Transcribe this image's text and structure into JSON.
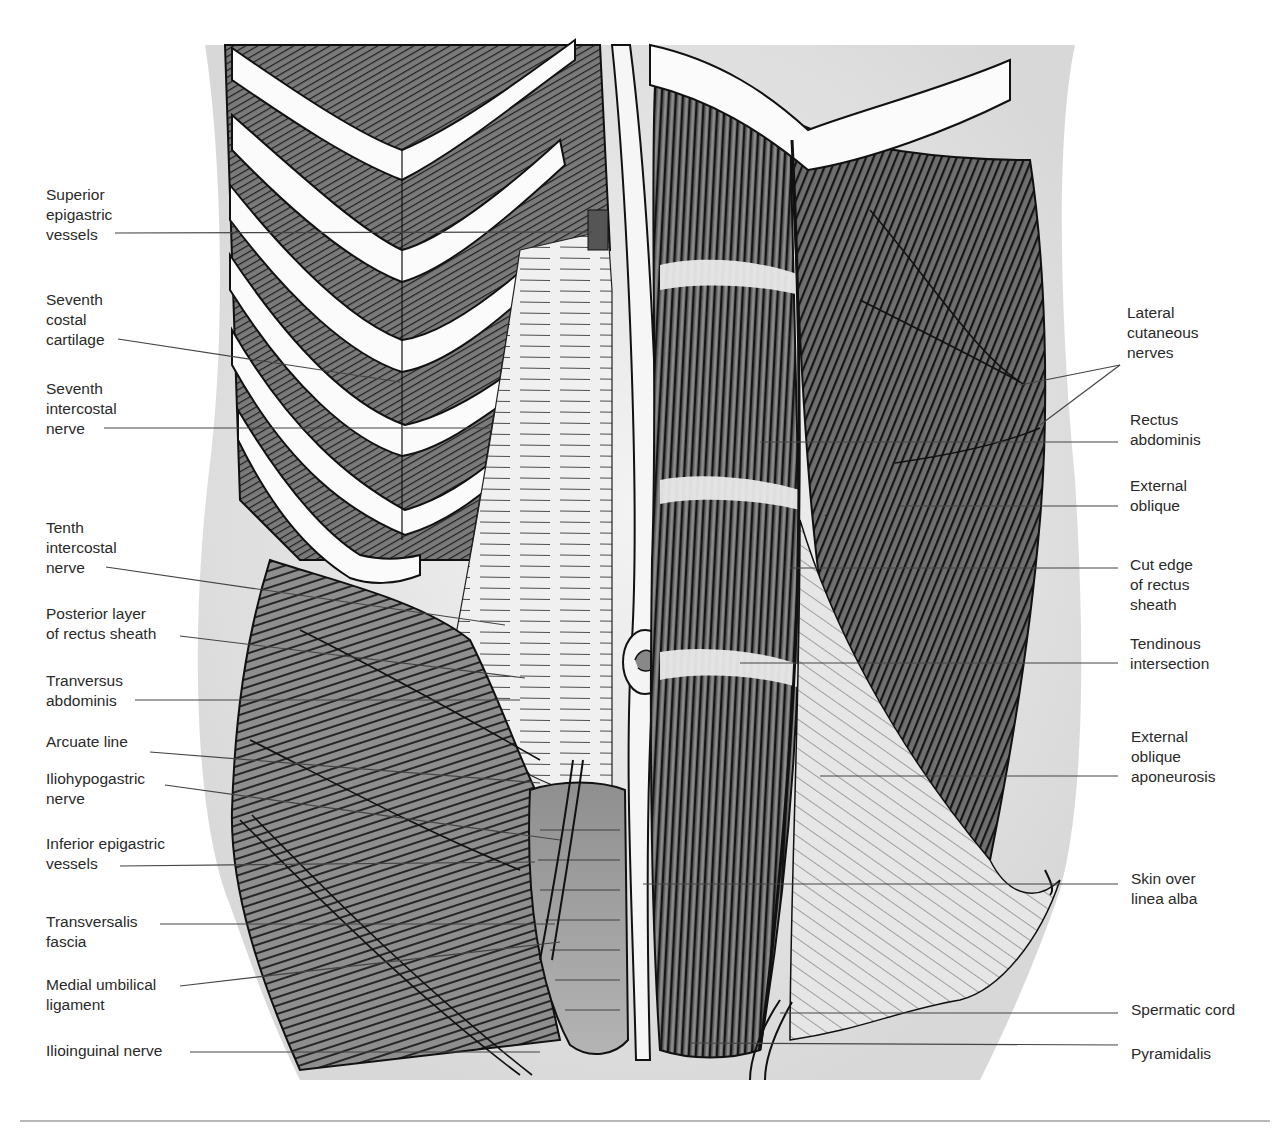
{
  "figure": {
    "colors": {
      "background": "#ffffff",
      "skin": "#efefef",
      "cartilage": "#fafafa",
      "muscle_dark": "#5a5a5a",
      "muscle_mid": "#8c8c8c",
      "sheath": "#e4e4e4",
      "fascia": "#9d9d9d",
      "line": "#1a1a1a",
      "leader": "#444444",
      "label_text": "#2a2a2a",
      "rule": "#b9b9b9"
    }
  },
  "labels_left": [
    {
      "id": "superior-epigastric-vessels",
      "text": "Superior\nepigastric\nvessels"
    },
    {
      "id": "seventh-costal-cartilage",
      "text": "Seventh\ncostal\ncartilage"
    },
    {
      "id": "seventh-intercostal-nerve",
      "text": "Seventh\nintercostal\nnerve"
    },
    {
      "id": "tenth-intercostal-nerve",
      "text": "Tenth\nintercostal\nnerve"
    },
    {
      "id": "posterior-layer-rectus-sheath",
      "text": "Posterior layer\nof rectus sheath"
    },
    {
      "id": "tranversus-abdominis",
      "text": "Tranversus\nabdominis"
    },
    {
      "id": "arcuate-line",
      "text": "Arcuate line"
    },
    {
      "id": "iliohypogastric-nerve",
      "text": "Iliohypogastric\nnerve"
    },
    {
      "id": "inferior-epigastric-vessels",
      "text": "Inferior epigastric\nvessels"
    },
    {
      "id": "transversalis-fascia",
      "text": "Transversalis\nfascia"
    },
    {
      "id": "medial-umbilical-ligament",
      "text": "Medial umbilical\nligament"
    },
    {
      "id": "ilioinguinal-nerve",
      "text": "Ilioinguinal nerve"
    }
  ],
  "labels_right": [
    {
      "id": "lateral-cutaneous-nerves",
      "text": "Lateral\ncutaneous\nnerves"
    },
    {
      "id": "rectus-abdominis",
      "text": "Rectus\nabdominis"
    },
    {
      "id": "external-oblique",
      "text": "External\noblique"
    },
    {
      "id": "cut-edge-rectus-sheath",
      "text": "Cut edge\nof rectus\nsheath"
    },
    {
      "id": "tendinous-intersection",
      "text": "Tendinous\nintersection"
    },
    {
      "id": "external-oblique-aponeurosis",
      "text": "External\noblique\naponeurosis"
    },
    {
      "id": "skin-over-linea-alba",
      "text": "Skin over\nlinea alba"
    },
    {
      "id": "spermatic-cord",
      "text": "Spermatic cord"
    },
    {
      "id": "pyramidalis",
      "text": "Pyramidalis"
    }
  ]
}
